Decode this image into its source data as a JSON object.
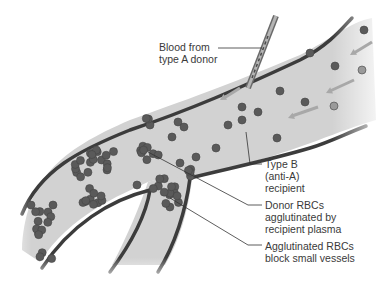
{
  "colors": {
    "vessel_fill": "#d2d2d2",
    "vessel_wall": "#3c3c3c",
    "rbc": "#5a5a5a",
    "rbc_faded": "#9a9a9a",
    "arrow": "#a8a8a8",
    "leader_line": "#333333",
    "text": "#3a3a3a"
  },
  "labels": {
    "donor": [
      "Blood from",
      "type A donor"
    ],
    "recipient": [
      "Type B",
      "(anti-A)",
      "recipient"
    ],
    "agglutinated": [
      "Donor RBCs",
      "agglutinated by",
      "recipient plasma"
    ],
    "block": [
      "Agglutinated RBCs",
      "block small vessels"
    ]
  },
  "icons": {
    "needle": "needle-icon",
    "flow_arrow": "flow-arrow-icon",
    "rbc": "red-blood-cell-icon"
  }
}
